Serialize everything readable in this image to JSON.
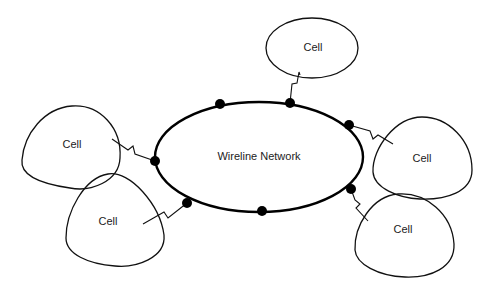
{
  "diagram": {
    "network": {
      "label": "Wireline Network",
      "stroke_color": "#000000"
    },
    "node_color": "#000000",
    "cells": [
      {
        "id": "cell-top",
        "label": "Cell"
      },
      {
        "id": "cell-left-upper",
        "label": "Cell"
      },
      {
        "id": "cell-left-lower",
        "label": "Cell"
      },
      {
        "id": "cell-right-upper",
        "label": "Cell"
      },
      {
        "id": "cell-right-lower",
        "label": "Cell"
      }
    ],
    "nodes_count": 7,
    "links_count": 5
  }
}
